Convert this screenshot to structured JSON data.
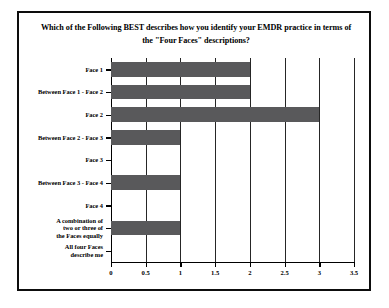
{
  "figure": {
    "background_color": "#ffffff",
    "frame_color": "#0d0d0d",
    "bar_color": "#59595b",
    "grid_color": "#262626"
  },
  "chart_data": {
    "type": "bar",
    "orientation": "horizontal",
    "title": "Which of the Following BEST describes how you identify your EMDR practice in terms of the \"Four Faces\" descriptions?",
    "title_lines": [
      "Which of the Following BEST describes how you identify your EMDR practice in terms of",
      "the \"Four Faces\" descriptions?"
    ],
    "categories": [
      "Face 1",
      "Between Face 1 - Face 2",
      "Face 2",
      "Between Face 2 - Face 3",
      "Face 3",
      "Between Face 3 - Face 4",
      "Face 4",
      "A combination of\ntwo or three of\nthe Faces equally",
      "All four Faces\ndescribe me"
    ],
    "values": [
      2,
      2,
      3,
      1,
      0,
      1,
      0,
      1,
      0
    ],
    "xlabel": "",
    "ylabel": "",
    "xlim": [
      0,
      3.5
    ],
    "xticks": [
      0,
      0.5,
      1,
      1.5,
      2,
      2.5,
      3,
      3.5
    ],
    "xticklabels": [
      "0",
      "0.5",
      "1",
      "1.5",
      "2",
      "2.5",
      "3",
      "3.5"
    ],
    "grid": true,
    "grid_axis": "x",
    "legend": null,
    "legend_position": "none"
  }
}
